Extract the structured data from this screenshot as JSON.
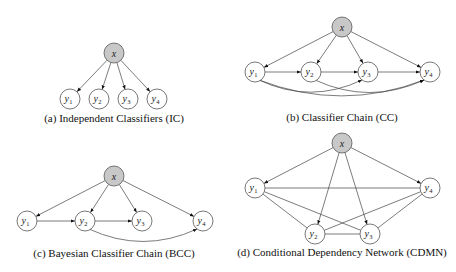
{
  "figure": {
    "panels": [
      {
        "id": "a",
        "caption": "(a) Independent Classifiers (IC)",
        "root": {
          "label": "x",
          "cx": 114,
          "cy": 53
        },
        "nodes": [
          {
            "label": "y",
            "sub": "1",
            "cx": 70,
            "cy": 99
          },
          {
            "label": "y",
            "sub": "2",
            "cx": 99,
            "cy": 99
          },
          {
            "label": "y",
            "sub": "3",
            "cx": 128,
            "cy": 99
          },
          {
            "label": "y",
            "sub": "4",
            "cx": 157,
            "cy": 99
          }
        ],
        "caption_pos": {
          "x": 114,
          "y": 122
        },
        "edges": [
          {
            "from": "x",
            "to": "y1",
            "directed": true
          },
          {
            "from": "x",
            "to": "y2",
            "directed": true
          },
          {
            "from": "x",
            "to": "y3",
            "directed": true
          },
          {
            "from": "x",
            "to": "y4",
            "directed": true
          }
        ]
      },
      {
        "id": "b",
        "caption": "(b) Classifier Chain (CC)",
        "root": {
          "label": "x",
          "cx": 342,
          "cy": 27
        },
        "nodes": [
          {
            "label": "y",
            "sub": "1",
            "cx": 255,
            "cy": 72
          },
          {
            "label": "y",
            "sub": "2",
            "cx": 311,
            "cy": 72
          },
          {
            "label": "y",
            "sub": "3",
            "cx": 368,
            "cy": 72
          },
          {
            "label": "y",
            "sub": "4",
            "cx": 430,
            "cy": 72
          }
        ],
        "caption_pos": {
          "x": 342,
          "y": 121
        },
        "edges": [
          {
            "from": "x",
            "to": "y1",
            "directed": true
          },
          {
            "from": "x",
            "to": "y2",
            "directed": true
          },
          {
            "from": "x",
            "to": "y3",
            "directed": true
          },
          {
            "from": "x",
            "to": "y4",
            "directed": true
          },
          {
            "from": "y1",
            "to": "y2",
            "directed": true
          },
          {
            "from": "y2",
            "to": "y3",
            "directed": true
          },
          {
            "from": "y3",
            "to": "y4",
            "directed": true
          },
          {
            "from": "y1",
            "to": "y3",
            "directed": true,
            "curved": true
          },
          {
            "from": "y2",
            "to": "y4",
            "directed": true,
            "curved": true
          },
          {
            "from": "y1",
            "to": "y4",
            "directed": true,
            "curved": true
          }
        ]
      },
      {
        "id": "c",
        "caption": "(c) Bayesian Classifier Chain (BCC)",
        "root": {
          "label": "x",
          "cx": 114,
          "cy": 176
        },
        "nodes": [
          {
            "label": "y",
            "sub": "1",
            "cx": 27,
            "cy": 221
          },
          {
            "label": "y",
            "sub": "2",
            "cx": 85,
            "cy": 221
          },
          {
            "label": "y",
            "sub": "3",
            "cx": 142,
            "cy": 221
          },
          {
            "label": "y",
            "sub": "4",
            "cx": 203,
            "cy": 221
          }
        ],
        "caption_pos": {
          "x": 114,
          "y": 257
        },
        "edges": [
          {
            "from": "x",
            "to": "y1",
            "directed": true
          },
          {
            "from": "x",
            "to": "y2",
            "directed": true
          },
          {
            "from": "x",
            "to": "y3",
            "directed": true
          },
          {
            "from": "x",
            "to": "y4",
            "directed": true
          },
          {
            "from": "y1",
            "to": "y2",
            "directed": true
          },
          {
            "from": "y2",
            "to": "y3",
            "directed": true
          },
          {
            "from": "y2",
            "to": "y4",
            "directed": true,
            "curved": true
          }
        ]
      },
      {
        "id": "d",
        "caption": "(d) Conditional Dependency Network (CDMN)",
        "root": {
          "label": "x",
          "cx": 342,
          "cy": 143
        },
        "nodes": [
          {
            "label": "y",
            "sub": "1",
            "cx": 255,
            "cy": 188
          },
          {
            "label": "y",
            "sub": "2",
            "cx": 315,
            "cy": 234
          },
          {
            "label": "y",
            "sub": "3",
            "cx": 370,
            "cy": 234
          },
          {
            "label": "y",
            "sub": "4",
            "cx": 430,
            "cy": 188
          }
        ],
        "caption_pos": {
          "x": 342,
          "y": 256
        },
        "edges": [
          {
            "from": "x",
            "to": "y1",
            "directed": true
          },
          {
            "from": "x",
            "to": "y2",
            "directed": true
          },
          {
            "from": "x",
            "to": "y3",
            "directed": true
          },
          {
            "from": "x",
            "to": "y4",
            "directed": true
          },
          {
            "from": "y1",
            "to": "y4",
            "directed": false
          },
          {
            "from": "y1",
            "to": "y2",
            "directed": false
          },
          {
            "from": "y1",
            "to": "y3",
            "directed": false
          },
          {
            "from": "y2",
            "to": "y3",
            "directed": false
          },
          {
            "from": "y2",
            "to": "y4",
            "directed": false
          },
          {
            "from": "y3",
            "to": "y4",
            "directed": false
          }
        ]
      }
    ]
  }
}
